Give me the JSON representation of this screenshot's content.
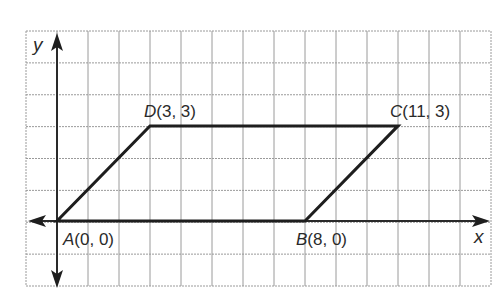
{
  "figure": {
    "type": "coordinate-plane-parallelogram",
    "axes": {
      "x_label": "x",
      "y_label": "y"
    },
    "grid": {
      "left": 26,
      "top": 31,
      "right": 491,
      "bottom": 286,
      "cols": 15,
      "rows": 8,
      "origin_px": [
        57,
        221
      ],
      "unit_x_px": 31,
      "unit_y_px": 31.7,
      "line_color": "#9a9a9a"
    },
    "points": [
      {
        "name": "A",
        "coords": "(0, 0)",
        "x": 0,
        "y": 0
      },
      {
        "name": "B",
        "coords": "(8, 0)",
        "x": 8,
        "y": 0
      },
      {
        "name": "C",
        "coords": "(11, 3)",
        "x": 11,
        "y": 3
      },
      {
        "name": "D",
        "coords": "(3, 3)",
        "x": 3,
        "y": 3
      }
    ],
    "labels": {
      "A": "A",
      "A_coords": "(0, 0)",
      "B": "B",
      "B_coords": "(8, 0)",
      "C": "C",
      "C_coords": "(11, 3)",
      "D": "D",
      "D_coords": "(3, 3)"
    },
    "colors": {
      "shape": "#1e1e1e",
      "axis": "#2a2a2a",
      "grid": "#9a9a9a"
    }
  }
}
